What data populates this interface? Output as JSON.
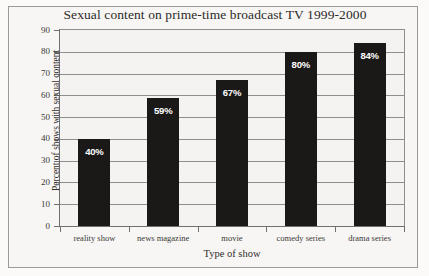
{
  "chart_data": {
    "type": "bar",
    "title": "Sexual content on prime-time broadcast TV 1999-2000",
    "xlabel": "Type of show",
    "ylabel": "Percent of shows with sexual content",
    "categories": [
      "reality show",
      "news magazine",
      "movie",
      "comedy series",
      "drama series"
    ],
    "values": [
      40,
      59,
      67,
      80,
      84
    ],
    "data_labels": [
      "40%",
      "59%",
      "67%",
      "80%",
      "84%"
    ],
    "ylim": [
      0,
      90
    ],
    "ytick_labels": [
      "0",
      "10",
      "20",
      "30",
      "40",
      "50",
      "60",
      "70",
      "80",
      "90"
    ],
    "ytick_values": [
      0,
      10,
      20,
      30,
      40,
      50,
      60,
      70,
      80,
      90
    ],
    "grid": true,
    "legend": "none",
    "bar_color": "#1a1917",
    "label_color": "#ffffff",
    "grid_color": "#8e8e8c",
    "background_color": "#f4f3f1"
  }
}
